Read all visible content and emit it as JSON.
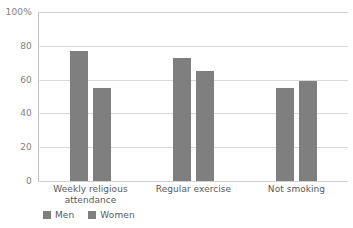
{
  "chart_data": {
    "type": "bar",
    "title": "",
    "subtitle": "",
    "xlabel": "",
    "ylabel": "",
    "categories": [
      "Weekly religious attendance",
      "Regular exercise",
      "Not smoking"
    ],
    "series": [
      {
        "name": "Men",
        "values": [
          77,
          73,
          55
        ]
      },
      {
        "name": "Women",
        "values": [
          55,
          65,
          59
        ]
      }
    ],
    "ylim": [
      0,
      100
    ],
    "yticks": [
      0,
      20,
      40,
      60,
      80,
      100
    ],
    "ytick_labels": [
      "0",
      "20",
      "40",
      "60",
      "80",
      "100%"
    ],
    "grid": true,
    "legend_position": "bottom-left",
    "bar_color": "#7f7f7f",
    "gridline_color": "#d9d9d9",
    "axis_color": "#bfbfbf",
    "text_color": "#595959"
  },
  "axis": {
    "tick_100": "100%",
    "tick_80": "80",
    "tick_60": "60",
    "tick_40": "40",
    "tick_20": "20",
    "tick_0": "0"
  },
  "categories": {
    "cat_0_line_1": "Weekly religious",
    "cat_0_line_2": "attendance",
    "cat_1_line_1": "Regular exercise",
    "cat_2_line_1": "Not smoking"
  },
  "legend": {
    "men": "Men",
    "women": "Women"
  }
}
